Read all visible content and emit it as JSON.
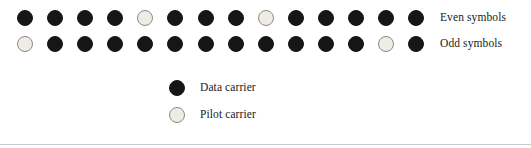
{
  "figure": {
    "type": "ofdm-pilot-pattern-diagram",
    "colors": {
      "data_carrier": "#161616",
      "pilot_carrier": "#eeece4",
      "pilot_carrier_border": "#8a8a84",
      "text": "#1a1a1a",
      "background": "#ffffff",
      "rule": "#c9c9c9"
    },
    "rows": [
      {
        "label": "Even symbols",
        "carrier_count": 14,
        "carriers": [
          "data",
          "data",
          "data",
          "data",
          "pilot",
          "data",
          "data",
          "data",
          "pilot",
          "data",
          "data",
          "data",
          "data",
          "data"
        ],
        "pilot_positions": [
          5,
          9
        ]
      },
      {
        "label": "Odd symbols",
        "carrier_count": 14,
        "carriers": [
          "pilot",
          "data",
          "data",
          "data",
          "data",
          "data",
          "data",
          "data",
          "data",
          "data",
          "data",
          "data",
          "pilot",
          "data"
        ],
        "pilot_positions": [
          1,
          13
        ]
      }
    ],
    "legend": [
      {
        "swatch": "data",
        "label": "Data carrier"
      },
      {
        "swatch": "pilot",
        "label": "Pilot carrier"
      }
    ],
    "layout": {
      "first_carrier_center_x": 25,
      "carrier_spacing_px": 30.1,
      "carrier_diameter_px": 16,
      "row_center_y": [
        18,
        44
      ],
      "label_x": 440,
      "legend_swatch_x": 169,
      "legend_rows_y": [
        80,
        107
      ]
    }
  }
}
